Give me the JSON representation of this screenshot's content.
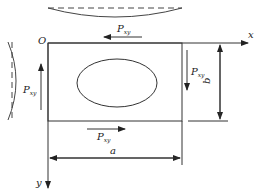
{
  "diagram": {
    "type": "plate-shear-loading",
    "origin_label": "O",
    "x_axis_label": "x",
    "y_axis_label": "y",
    "width_label": "a",
    "height_label": "b",
    "load_symbol": "P",
    "load_subscript": "xy",
    "loads": [
      {
        "position": "top",
        "direction": "left"
      },
      {
        "position": "right",
        "direction": "down"
      },
      {
        "position": "bottom",
        "direction": "right"
      },
      {
        "position": "left",
        "direction": "up"
      }
    ],
    "buckle_shapes": [
      "top",
      "left"
    ],
    "cutout": "ellipse",
    "colors": {
      "line": "#333333",
      "background": "#ffffff"
    }
  }
}
